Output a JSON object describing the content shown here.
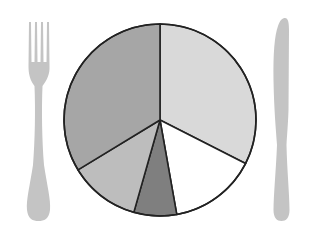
{
  "chart_data": {
    "type": "pie",
    "title": "",
    "start_angle_deg": 0,
    "direction": "clockwise",
    "categories": [
      "Slice 1",
      "Slice 2",
      "Slice 3",
      "Slice 4",
      "Slice 5"
    ],
    "values": [
      32.5,
      14.7,
      7.2,
      11.9,
      33.7
    ],
    "colors": [
      "#d9d9d9",
      "#ffffff",
      "#7f7f7f",
      "#bdbdbd",
      "#a6a6a6"
    ],
    "labels_shown": false,
    "legend": "none",
    "decoration": "pie drawn as a dinner plate flanked by a fork (left) and a knife (right)"
  },
  "scene": {
    "background": "#ffffff",
    "pie": {
      "cx": 160,
      "cy": 120,
      "r": 96,
      "stroke": "#222222",
      "stroke_width": 1.6
    },
    "utensil_color": "#c4c4c4",
    "fork": {
      "icon": "fork-icon"
    },
    "knife": {
      "icon": "knife-icon"
    }
  }
}
